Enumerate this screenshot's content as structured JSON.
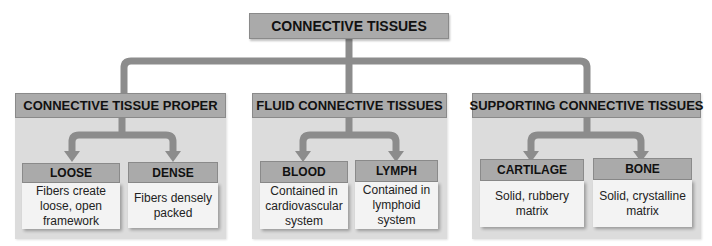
{
  "root": {
    "label": "CONNECTIVE TISSUES"
  },
  "categories": [
    {
      "label": "CONNECTIVE TISSUE PROPER",
      "children": [
        {
          "label": "LOOSE",
          "description": "Fibers create loose, open framework"
        },
        {
          "label": "DENSE",
          "description": "Fibers densely packed"
        }
      ]
    },
    {
      "label": "FLUID CONNECTIVE TISSUES",
      "children": [
        {
          "label": "BLOOD",
          "description": "Contained in cardiovascular system"
        },
        {
          "label": "LYMPH",
          "description": "Contained in lymphoid system"
        }
      ]
    },
    {
      "label": "SUPPORTING CONNECTIVE TISSUES",
      "children": [
        {
          "label": "CARTILAGE",
          "description": "Solid, rubbery matrix"
        },
        {
          "label": "BONE",
          "description": "Solid, crystalline matrix"
        }
      ]
    }
  ],
  "colors": {
    "header_fill": "#aaaaaa",
    "panel_fill": "#dcdcdc",
    "body_fill": "#f3f3f3",
    "connector": "#8c8c8c"
  }
}
